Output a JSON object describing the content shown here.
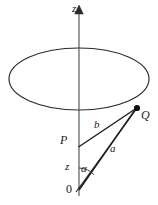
{
  "figure": {
    "kind": "geometry-diagram",
    "background_color": "#ffffff",
    "stroke_color": "#1a1a1a",
    "labels": {
      "z_axis": "z",
      "point_q": "Q",
      "segment_b": "b",
      "point_p": "P",
      "segment_a": "a",
      "segment_z": "z",
      "angle_alpha": "α",
      "origin": "0"
    },
    "geometry": {
      "axis_x": 79,
      "axis_top_y": 8,
      "axis_bottom_y": 196,
      "arrow_tip_y": 6,
      "ellipse": {
        "cx": 79,
        "cy": 79,
        "rx": 70,
        "ry": 31
      },
      "origin_point": {
        "x": 79,
        "y": 190
      },
      "point_p": {
        "x": 78,
        "y": 147
      },
      "point_q": {
        "x": 137,
        "y": 108
      },
      "angle_arc_radius": 22
    }
  }
}
